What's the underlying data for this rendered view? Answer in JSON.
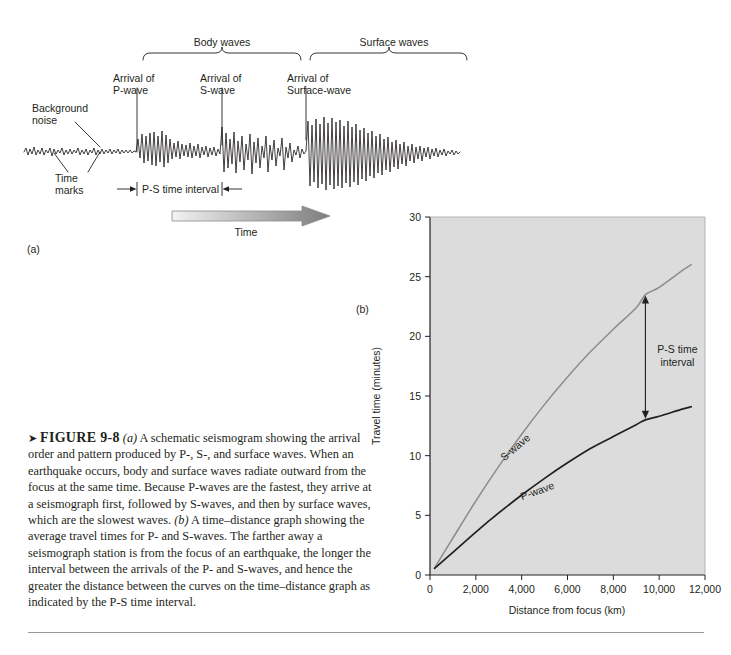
{
  "figure": {
    "number": "FIGURE 9-8",
    "panel_a_tag": "(a)",
    "panel_b_tag": "(b)",
    "caption_parts": {
      "lead_icon": "➤",
      "p1_italic": "(a)",
      "p1": " A schematic seismogram showing the arrival order and pattern produced by P-, S-, and surface waves. When an earthquake occurs, body and surface waves radiate outward from the focus at the same time. Because P-waves are the fastest, they arrive at a seismograph first, followed by S-waves, and then by surface waves, which are the slowest waves. ",
      "p2_italic": "(b)",
      "p2": " A time–distance graph showing the average travel times for P- and S-waves. The farther away a seismograph station is from the focus of an earthquake, the longer the interval between the arrivals of the P- and S-waves, and hence the greater the distance between the curves on the time–distance graph as indicated by the P-S time interval."
    }
  },
  "seismogram": {
    "brackets": [
      {
        "label": "Body waves"
      },
      {
        "label": "Surface waves"
      }
    ],
    "arrivals": [
      {
        "label": "Arrival of\nP-wave"
      },
      {
        "label": "Arrival of\nS-wave"
      },
      {
        "label": "Arrival of\nSurface-wave"
      }
    ],
    "background_noise_label": "Background\nnoise",
    "time_marks_label": "Time\nmarks",
    "ps_interval_label": "P-S time interval",
    "time_arrow_label": "Time"
  },
  "chart_data": {
    "type": "line",
    "title": "",
    "xlabel": "Distance from focus (km)",
    "ylabel": "Travel time (minutes)",
    "xlim": [
      0,
      12000
    ],
    "ylim": [
      0,
      30
    ],
    "xticks": [
      0,
      2000,
      4000,
      6000,
      8000,
      10000,
      12000
    ],
    "xticklabels": [
      "0",
      "2,000",
      "4,000",
      "6,000",
      "8,000",
      "10,000",
      "12,000"
    ],
    "yticks": [
      0,
      5,
      10,
      15,
      20,
      25,
      30
    ],
    "yticklabels": [
      "0",
      "5",
      "10",
      "15",
      "20",
      "25",
      "30"
    ],
    "grid": false,
    "legend": "inline-labels",
    "plot_bg": "#dcdcdc",
    "series": [
      {
        "name": "S-wave",
        "color": "#8c8c8c",
        "label": "S-wave",
        "x": [
          200,
          1000,
          2000,
          3000,
          4000,
          5000,
          6000,
          7000,
          8000,
          9000,
          9400,
          10000,
          11000,
          11400
        ],
        "y": [
          0.6,
          3.1,
          6.2,
          9.1,
          11.8,
          14.3,
          16.6,
          18.7,
          20.6,
          22.4,
          23.5,
          24.1,
          25.5,
          26.0
        ]
      },
      {
        "name": "P-wave",
        "color": "#231f20",
        "label": "P-wave",
        "x": [
          200,
          1000,
          2000,
          3000,
          4000,
          5000,
          6000,
          7000,
          8000,
          9000,
          9400,
          10000,
          11000,
          11400
        ],
        "y": [
          0.55,
          1.9,
          3.6,
          5.2,
          6.7,
          8.1,
          9.4,
          10.6,
          11.6,
          12.6,
          13.0,
          13.3,
          13.9,
          14.1
        ]
      }
    ],
    "annotations": [
      {
        "name": "ps-time-interval",
        "label": "P-S time\ninterval",
        "x": 9400,
        "y_top": 23.5,
        "y_bottom": 13.0,
        "style": "double-headed-arrow"
      }
    ]
  }
}
